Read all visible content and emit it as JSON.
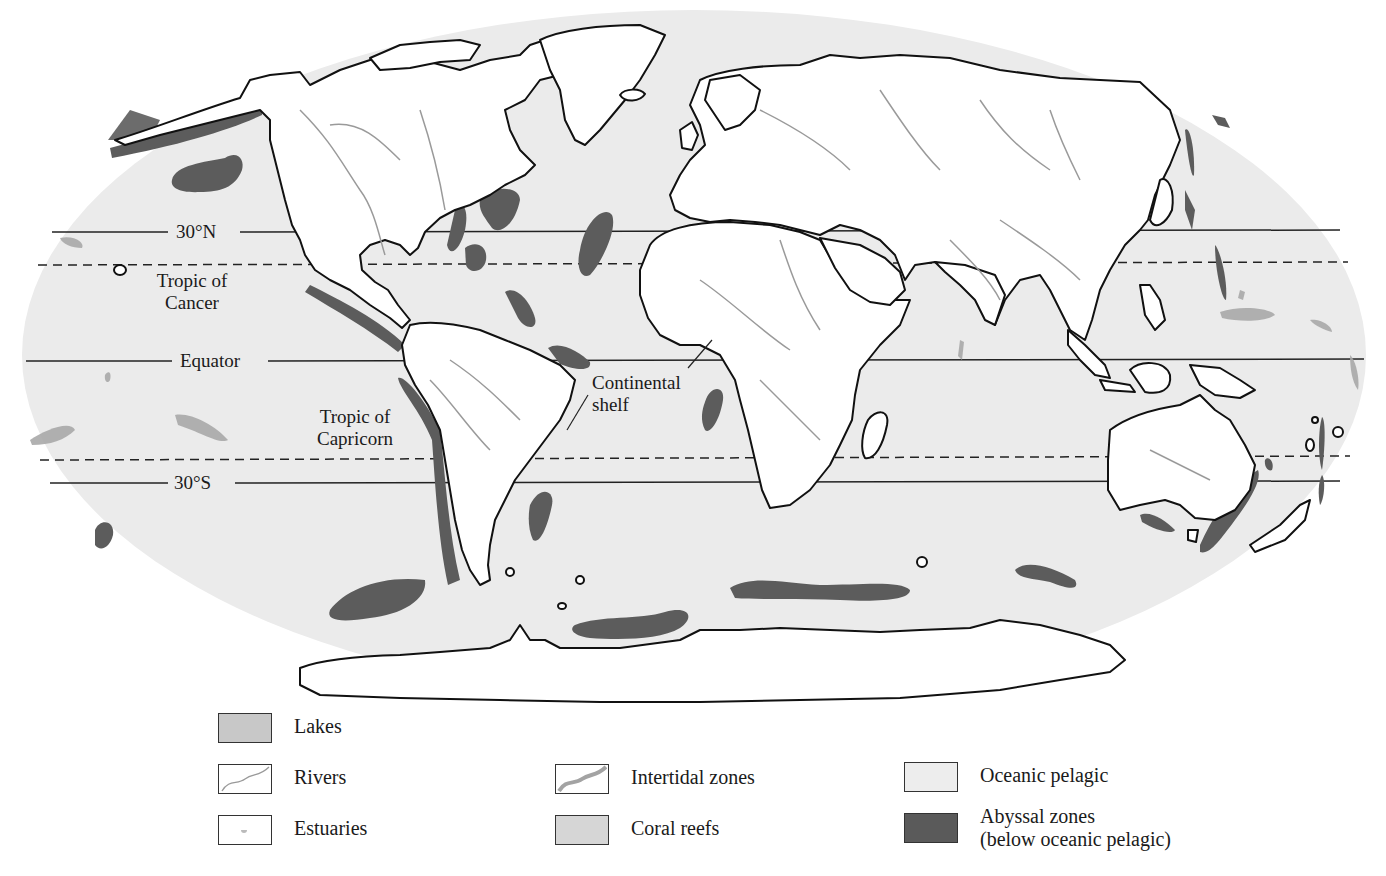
{
  "map": {
    "latitude_lines": {
      "n30": "30°N",
      "tropic_cancer": [
        "Tropic of",
        "Cancer"
      ],
      "equator": "Equator",
      "tropic_capricorn": [
        "Tropic of",
        "Capricorn"
      ],
      "s30": "30°S"
    },
    "annotations": {
      "continental_shelf": [
        "Continental",
        "shelf"
      ]
    }
  },
  "legend": {
    "items": [
      {
        "key": "lakes",
        "label": "Lakes",
        "swatch": "lakes-swatch",
        "fill": "#c8c8c8"
      },
      {
        "key": "rivers",
        "label": "Rivers",
        "swatch": "rivers-swatch",
        "fill": "#ffffff"
      },
      {
        "key": "estuaries",
        "label": "Estuaries",
        "swatch": "estuaries-swatch",
        "fill": "#ffffff"
      },
      {
        "key": "intertidal",
        "label": "Intertidal zones",
        "swatch": "intertidal-swatch",
        "fill": "#ffffff"
      },
      {
        "key": "coral",
        "label": "Coral reefs",
        "swatch": "coral-swatch",
        "fill": "#d6d6d6"
      },
      {
        "key": "pelagic",
        "label": "Oceanic pelagic",
        "swatch": "pelagic-swatch",
        "fill": "#ededed"
      },
      {
        "key": "abyssal",
        "label": "Abyssal zones",
        "label2": "(below oceanic pelagic)",
        "swatch": "abyssal-swatch",
        "fill": "#5a5a5a"
      }
    ]
  },
  "colors": {
    "ocean": "#ebebeb",
    "land": "#ffffff",
    "abyssal": "#5c5c5c",
    "coral": "#a9a9a9",
    "river": "#a0a0a0",
    "coast": "#111111"
  }
}
